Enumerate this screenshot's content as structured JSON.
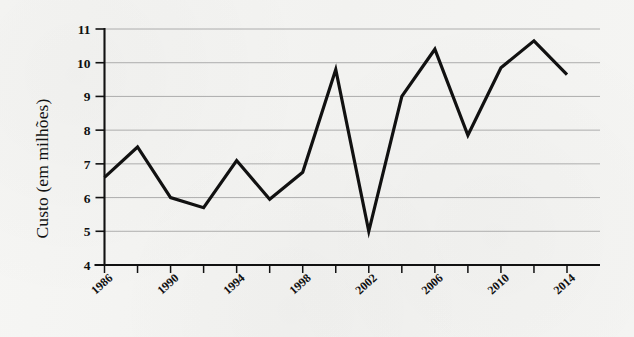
{
  "figure": {
    "background_color": "#f4f4f2",
    "ink_color": "#111111",
    "grid_color": "#9a9a9a"
  },
  "axes": {
    "y_title": "Custo (em milhões)",
    "y_ticks": [
      "11",
      "10",
      "9",
      "8",
      "7",
      "6",
      "5",
      "4"
    ],
    "x_ticks_labeled": [
      "1986",
      "1990",
      "1994",
      "1998",
      "2002",
      "2006",
      "2010",
      "2014"
    ]
  },
  "chart_data": {
    "type": "line",
    "title": "",
    "xlabel": "",
    "ylabel": "Custo (em milhões)",
    "xlim": [
      1986,
      2014
    ],
    "ylim": [
      4,
      11
    ],
    "grid": true,
    "grid_axis": "y",
    "legend": "none",
    "marker": "none",
    "line_color": "#111111",
    "line_width": 3.2,
    "x_tick_step": 2,
    "x_label_step": 4,
    "y_tick_step": 1,
    "x": [
      1986,
      1988,
      1990,
      1992,
      1994,
      1996,
      1998,
      2000,
      2002,
      2004,
      2006,
      2008,
      2010,
      2012,
      2014
    ],
    "values": [
      6.6,
      7.5,
      6.0,
      5.7,
      7.1,
      5.95,
      6.75,
      9.8,
      5.0,
      9.0,
      10.4,
      7.85,
      9.85,
      10.65,
      9.65
    ],
    "series": [
      {
        "name": "Custo",
        "values": [
          6.6,
          7.5,
          6.0,
          5.7,
          7.1,
          5.95,
          6.75,
          9.8,
          5.0,
          9.0,
          10.4,
          7.85,
          9.85,
          10.65,
          9.65
        ]
      }
    ],
    "categories": [
      "1986",
      "1988",
      "1990",
      "1992",
      "1994",
      "1996",
      "1998",
      "2000",
      "2002",
      "2004",
      "2006",
      "2008",
      "2010",
      "2012",
      "2014"
    ]
  }
}
